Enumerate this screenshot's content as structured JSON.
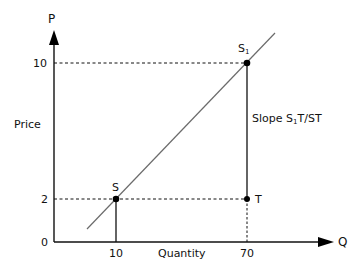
{
  "axes": {
    "y_axis_letter": "P",
    "x_axis_letter": "Q",
    "y_axis_title": "Price",
    "x_axis_title": "Quantity",
    "y_ticks": [
      "10",
      "2",
      "0"
    ],
    "x_ticks": [
      "10",
      "70"
    ]
  },
  "points": {
    "s": {
      "label": "S"
    },
    "s1": {
      "label": "S",
      "sub": "1"
    },
    "t": {
      "label": "T"
    }
  },
  "annotation": {
    "prefix": "Slope S",
    "sub": "1",
    "suffix": "T/ST"
  },
  "colors": {
    "line": "#6b6b6b",
    "axes": "#111111",
    "points": "#000000"
  }
}
